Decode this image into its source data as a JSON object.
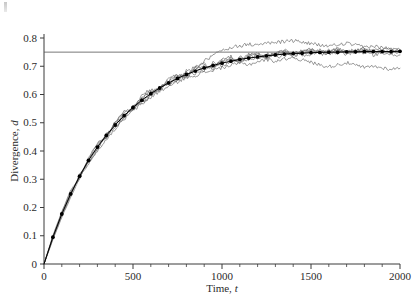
{
  "chart_data": {
    "type": "line",
    "title": "",
    "xlabel": "Time, t",
    "ylabel": "Divergence, d",
    "xlim": [
      0,
      2000
    ],
    "ylim": [
      0,
      0.8
    ],
    "x_major_ticks": [
      0,
      500,
      1000,
      1500,
      2000
    ],
    "x_major_tick_labels": [
      "0",
      "500",
      "1000",
      "1500",
      "2000"
    ],
    "x_minor_tick_interval": 100,
    "y_major_ticks": [
      0,
      0.1,
      0.2,
      0.3,
      0.4,
      0.5,
      0.6,
      0.7,
      0.8
    ],
    "y_major_tick_labels": [
      "0",
      "0.1",
      "0.2",
      "0.3",
      "0.4",
      "0.5",
      "0.6",
      "0.7",
      "0.8"
    ],
    "grid": false,
    "legend": "none",
    "spines": [
      "left",
      "bottom"
    ],
    "tick_direction": "out",
    "annotations": [
      {
        "name": "asymptote-line",
        "type": "horizontal-line",
        "y": 0.75,
        "x_start": 0,
        "x_end": 2000,
        "color": "#555555"
      }
    ],
    "x": [
      0,
      50,
      100,
      150,
      200,
      250,
      300,
      350,
      400,
      450,
      500,
      550,
      600,
      650,
      700,
      750,
      800,
      850,
      900,
      950,
      1000,
      1050,
      1100,
      1150,
      1200,
      1250,
      1300,
      1350,
      1400,
      1450,
      1500,
      1550,
      1600,
      1650,
      1700,
      1750,
      1800,
      1850,
      1900,
      1950,
      2000
    ],
    "series": [
      {
        "name": "mean",
        "style": "line-with-dot-markers",
        "color": "#000000",
        "marker": "filled-circle",
        "values": [
          0.0,
          0.095,
          0.177,
          0.248,
          0.311,
          0.367,
          0.414,
          0.455,
          0.492,
          0.525,
          0.554,
          0.58,
          0.603,
          0.623,
          0.641,
          0.657,
          0.671,
          0.683,
          0.694,
          0.703,
          0.711,
          0.718,
          0.724,
          0.729,
          0.733,
          0.737,
          0.74,
          0.743,
          0.745,
          0.746,
          0.748,
          0.749,
          0.75,
          0.75,
          0.751,
          0.751,
          0.752,
          0.752,
          0.752,
          0.752,
          0.753
        ]
      },
      {
        "name": "replicate-1",
        "style": "thin-noisy-line",
        "color": "#6e6e6e",
        "values": [
          0.0,
          0.101,
          0.185,
          0.255,
          0.305,
          0.372,
          0.425,
          0.448,
          0.5,
          0.536,
          0.548,
          0.59,
          0.612,
          0.617,
          0.651,
          0.668,
          0.662,
          0.692,
          0.701,
          0.696,
          0.722,
          0.728,
          0.717,
          0.736,
          0.742,
          0.731,
          0.748,
          0.752,
          0.741,
          0.754,
          0.758,
          0.747,
          0.756,
          0.762,
          0.751,
          0.759,
          0.764,
          0.753,
          0.761,
          0.757,
          0.752
        ]
      },
      {
        "name": "replicate-2",
        "style": "thin-noisy-line",
        "color": "#6e6e6e",
        "values": [
          0.0,
          0.089,
          0.17,
          0.241,
          0.318,
          0.358,
          0.405,
          0.463,
          0.483,
          0.517,
          0.562,
          0.571,
          0.596,
          0.632,
          0.634,
          0.648,
          0.68,
          0.675,
          0.688,
          0.712,
          0.704,
          0.712,
          0.733,
          0.722,
          0.727,
          0.745,
          0.734,
          0.737,
          0.752,
          0.74,
          0.742,
          0.756,
          0.744,
          0.746,
          0.757,
          0.746,
          0.748,
          0.758,
          0.747,
          0.749,
          0.756
        ]
      },
      {
        "name": "replicate-3",
        "style": "thin-noisy-line",
        "color": "#6e6e6e",
        "values": [
          0.0,
          0.098,
          0.182,
          0.262,
          0.3,
          0.376,
          0.43,
          0.442,
          0.505,
          0.541,
          0.541,
          0.597,
          0.618,
          0.61,
          0.657,
          0.673,
          0.657,
          0.698,
          0.707,
          0.69,
          0.727,
          0.734,
          0.711,
          0.742,
          0.748,
          0.725,
          0.742,
          0.758,
          0.735,
          0.748,
          0.76,
          0.739,
          0.75,
          0.762,
          0.741,
          0.752,
          0.758,
          0.74,
          0.748,
          0.744,
          0.74
        ]
      },
      {
        "name": "replicate-4-overshoot",
        "style": "thin-noisy-line",
        "color": "#6e6e6e",
        "values": [
          0.0,
          0.092,
          0.174,
          0.245,
          0.314,
          0.362,
          0.409,
          0.458,
          0.487,
          0.52,
          0.557,
          0.575,
          0.599,
          0.627,
          0.637,
          0.652,
          0.684,
          0.694,
          0.718,
          0.739,
          0.755,
          0.768,
          0.772,
          0.778,
          0.775,
          0.781,
          0.784,
          0.788,
          0.79,
          0.786,
          0.78,
          0.774,
          0.772,
          0.776,
          0.781,
          0.774,
          0.768,
          0.771,
          0.766,
          0.762,
          0.758
        ]
      },
      {
        "name": "replicate-5-undershoot",
        "style": "thin-noisy-line",
        "color": "#6e6e6e",
        "values": [
          0.0,
          0.086,
          0.166,
          0.236,
          0.306,
          0.354,
          0.4,
          0.441,
          0.478,
          0.512,
          0.543,
          0.566,
          0.59,
          0.612,
          0.628,
          0.644,
          0.662,
          0.668,
          0.678,
          0.686,
          0.695,
          0.703,
          0.712,
          0.706,
          0.716,
          0.724,
          0.718,
          0.726,
          0.732,
          0.722,
          0.714,
          0.705,
          0.698,
          0.706,
          0.712,
          0.703,
          0.695,
          0.7,
          0.694,
          0.69,
          0.693
        ]
      },
      {
        "name": "replicate-6",
        "style": "thin-noisy-line",
        "color": "#6e6e6e",
        "values": [
          0.0,
          0.094,
          0.179,
          0.252,
          0.308,
          0.37,
          0.418,
          0.452,
          0.496,
          0.53,
          0.551,
          0.585,
          0.607,
          0.62,
          0.646,
          0.663,
          0.668,
          0.687,
          0.698,
          0.7,
          0.716,
          0.723,
          0.721,
          0.733,
          0.739,
          0.736,
          0.744,
          0.75,
          0.744,
          0.751,
          0.754,
          0.748,
          0.753,
          0.757,
          0.75,
          0.755,
          0.759,
          0.751,
          0.755,
          0.752,
          0.75
        ]
      }
    ]
  }
}
